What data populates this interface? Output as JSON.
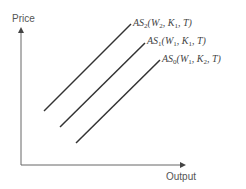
{
  "diagram": {
    "y_axis_label": "Price",
    "x_axis_label": "Output",
    "curves": [
      {
        "name": "AS",
        "sub": "2",
        "args": [
          {
            "v": "W",
            "s": "2"
          },
          {
            "v": "K",
            "s": "1"
          },
          {
            "v": "T",
            "s": ""
          }
        ]
      },
      {
        "name": "AS",
        "sub": "1",
        "args": [
          {
            "v": "W",
            "s": "1"
          },
          {
            "v": "K",
            "s": "1"
          },
          {
            "v": "T",
            "s": ""
          }
        ]
      },
      {
        "name": "AS",
        "sub": "0",
        "args": [
          {
            "v": "W",
            "s": "1"
          },
          {
            "v": "K",
            "s": "2"
          },
          {
            "v": "T",
            "s": ""
          }
        ]
      }
    ],
    "colors": {
      "axis": "#555555",
      "curve": "#333333"
    }
  }
}
